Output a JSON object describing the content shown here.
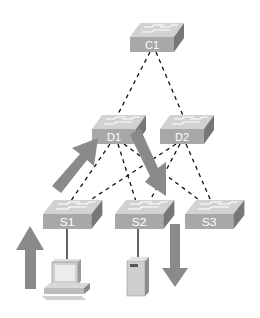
{
  "diagram": {
    "type": "hierarchical network topology",
    "switches": [
      {
        "id": "C1",
        "label": "C1",
        "layer": "core"
      },
      {
        "id": "D1",
        "label": "D1",
        "layer": "distribution"
      },
      {
        "id": "D2",
        "label": "D2",
        "layer": "distribution"
      },
      {
        "id": "S1",
        "label": "S1",
        "layer": "access"
      },
      {
        "id": "S2",
        "label": "S2",
        "layer": "access"
      },
      {
        "id": "S3",
        "label": "S3",
        "layer": "access"
      }
    ],
    "redundant_links": [
      [
        "C1",
        "D1"
      ],
      [
        "C1",
        "D2"
      ],
      [
        "D1",
        "S1"
      ],
      [
        "D1",
        "S2"
      ],
      [
        "D1",
        "S3"
      ],
      [
        "D2",
        "S1"
      ],
      [
        "D2",
        "S2"
      ],
      [
        "D2",
        "S3"
      ]
    ],
    "solid_links": [
      [
        "S1",
        "PC"
      ],
      [
        "S2",
        "Server"
      ]
    ],
    "endpoints": [
      {
        "id": "PC",
        "type": "workstation",
        "attached_to": "S1"
      },
      {
        "id": "Server",
        "type": "server",
        "attached_to": "S2"
      }
    ],
    "traffic_arrows": [
      {
        "direction": "up",
        "from": "PC",
        "to": "S1"
      },
      {
        "direction": "up-right",
        "from": "S1",
        "to": "D1"
      },
      {
        "direction": "down-right",
        "from": "D1",
        "to": "S2"
      },
      {
        "direction": "down",
        "from": "S2",
        "to": "Server"
      }
    ],
    "colors": {
      "switch_front": "#a9a9a9",
      "switch_top": "#d0d0d0",
      "switch_side": "#7a7a7a",
      "arrow": "#8a8a8a",
      "link": "#111111"
    }
  }
}
